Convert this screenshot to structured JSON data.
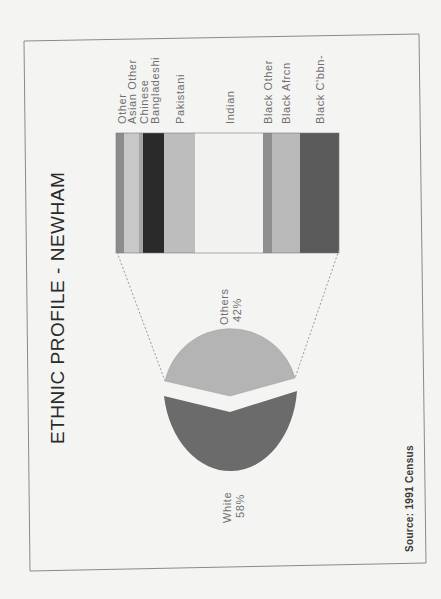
{
  "title": "ETHNIC PROFILE - NEWHAM",
  "source": "Source: 1991 Census",
  "colors": {
    "background": "#f4f4f2",
    "frame": "#8a8a8a",
    "white_slice": "#6b6b6b",
    "others_slice": "#b4b4b4",
    "connector": "#9a9a9a"
  },
  "chart_data": [
    {
      "type": "pie",
      "title": "ETHNIC PROFILE - NEWHAM",
      "categories": [
        "White",
        "Others"
      ],
      "values": [
        58,
        42
      ],
      "labels": [
        "White 58%",
        "Others 42%"
      ],
      "exploded": true,
      "orientation": "rotated 90° counter-clockwise"
    },
    {
      "type": "bar",
      "subtype": "stacked-100 (breakdown of Others 42%)",
      "categories": [
        "Other",
        "Asian Other",
        "Chinese",
        "Bangladeshi",
        "Pakistani",
        "Indian",
        "Black Other",
        "Black Afrcn",
        "Black C'bbn-"
      ],
      "values_pct_of_total_population_est": [
        1.5,
        2.8,
        0.8,
        4.0,
        5.8,
        12.8,
        1.7,
        5.3,
        7.3
      ],
      "values_pct_of_others_est": [
        3.6,
        6.7,
        1.8,
        9.4,
        13.9,
        30.5,
        4.0,
        12.6,
        17.5
      ],
      "colors": [
        "#8c8c8c",
        "#c8c8c8",
        "#a6a6a6",
        "#2a2a2a",
        "#bdbdbd",
        "#f2f2f0",
        "#8f8f8f",
        "#b9b9b9",
        "#5a5a5a"
      ],
      "note": "values estimated from segment widths"
    }
  ],
  "pie": {
    "white_label": "White",
    "white_pct": "58%",
    "others_label": "Others",
    "others_pct": "42%"
  },
  "bar": {
    "segments": [
      {
        "label": "Other",
        "x0": 116,
        "x1": 124,
        "color": "#8c8c8c"
      },
      {
        "label": "Asian Other",
        "x0": 124,
        "x1": 139,
        "color": "#c8c8c8"
      },
      {
        "label": "Chinese",
        "x0": 139,
        "x1": 143,
        "color": "#a6a6a6"
      },
      {
        "label": "Bangladeshi",
        "x0": 143,
        "x1": 164,
        "color": "#2a2a2a"
      },
      {
        "label": "Pakistani",
        "x0": 164,
        "x1": 195,
        "color": "#bdbdbd"
      },
      {
        "label": "Indian",
        "x0": 195,
        "x1": 263,
        "color": "#f2f2f0"
      },
      {
        "label": "Black Other",
        "x0": 263,
        "x1": 272,
        "color": "#8f8f8f"
      },
      {
        "label": "Black Afrcn",
        "x0": 272,
        "x1": 300,
        "color": "#b9b9b9"
      },
      {
        "label": "Black C'bbn-",
        "x0": 300,
        "x1": 339,
        "color": "#5a5a5a"
      }
    ]
  }
}
